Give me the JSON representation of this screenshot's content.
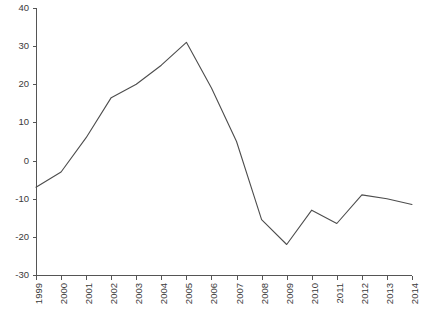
{
  "chart_data": {
    "type": "line",
    "title": "",
    "subtitle": "",
    "xlabel": "",
    "ylabel": "",
    "categories": [
      "1999",
      "2000",
      "2001",
      "2002",
      "2003",
      "2004",
      "2005",
      "2006",
      "2007",
      "2008",
      "2009",
      "2010",
      "2011",
      "2012",
      "2013",
      "2014"
    ],
    "values": [
      -7,
      -3,
      6,
      16.5,
      20,
      25,
      31,
      19,
      5,
      -15.5,
      -22,
      -13,
      -16.5,
      -9,
      -10,
      -11.5
    ],
    "series": [
      {
        "name": "series-1",
        "values": [
          -7,
          -3,
          6,
          16.5,
          20,
          25,
          31,
          19,
          5,
          -15.5,
          -22,
          -13,
          -16.5,
          -9,
          -10,
          -11.5
        ]
      }
    ],
    "ylim": [
      -30,
      40
    ],
    "xlim": [
      "1999",
      "2014"
    ],
    "y_ticks": [
      -30,
      -20,
      -10,
      0,
      10,
      20,
      30,
      40
    ],
    "y_tick_labels": [
      "-30",
      "-20",
      "-10",
      "0",
      "10",
      "20",
      "30",
      "40"
    ],
    "x_ticks": [
      "1999",
      "2000",
      "2001",
      "2002",
      "2003",
      "2004",
      "2005",
      "2006",
      "2007",
      "2008",
      "2009",
      "2010",
      "2011",
      "2012",
      "2013",
      "2014"
    ],
    "x_tick_labels": [
      "1999",
      "2000",
      "2001",
      "2002",
      "2003",
      "2004",
      "2005",
      "2006",
      "2007",
      "2008",
      "2009",
      "2010",
      "2011",
      "2012",
      "2013",
      "2014"
    ],
    "x_tick_label_rotation": -90,
    "grid": false,
    "legend": null,
    "legend_position": "none",
    "line_color": "#4d4d4d",
    "axis_color": "#555555",
    "background_color": "#ffffff",
    "annotations": []
  },
  "figure": {
    "plot_left_px": 36,
    "plot_right_px": 412,
    "plot_top_px": 8,
    "plot_bottom_px": 275
  }
}
